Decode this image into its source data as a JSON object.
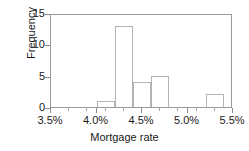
{
  "chart_data": {
    "type": "bar",
    "title": "",
    "subtitle": "",
    "xlabel": "Mortgage rate",
    "ylabel": "Frequency",
    "xlim": [
      3.5,
      5.5
    ],
    "ylim": [
      0,
      15
    ],
    "grid": false,
    "legend": null,
    "bin_width": 0.2,
    "x_tick_labels": [
      "3.5%",
      "4.0%",
      "4.5%",
      "5.0%",
      "5.5%"
    ],
    "x_tick_values": [
      3.5,
      4.0,
      4.5,
      5.0,
      5.5
    ],
    "x_minor_tick_values": [
      3.7,
      3.9,
      4.1,
      4.3,
      4.7,
      4.9,
      5.1,
      5.3
    ],
    "y_tick_labels": [
      "0",
      "5",
      "10",
      "15"
    ],
    "y_tick_values": [
      0,
      5,
      10,
      15
    ],
    "bins": [
      {
        "label": "4.0%-4.2%",
        "x0": 4.0,
        "x1": 4.2,
        "value": 1
      },
      {
        "label": "4.2%-4.4%",
        "x0": 4.2,
        "x1": 4.4,
        "value": 13
      },
      {
        "label": "4.4%-4.6%",
        "x0": 4.4,
        "x1": 4.6,
        "value": 4
      },
      {
        "label": "4.6%-4.8%",
        "x0": 4.6,
        "x1": 4.8,
        "value": 5
      },
      {
        "label": "5.2%-5.4%",
        "x0": 5.2,
        "x1": 5.4,
        "value": 2
      }
    ],
    "categories": [
      "4.0%-4.2%",
      "4.2%-4.4%",
      "4.4%-4.6%",
      "4.6%-4.8%",
      "5.2%-5.4%"
    ],
    "values": [
      1,
      13,
      4,
      5,
      2
    ],
    "colors": {
      "bar_edge": "#b3b3b3",
      "bar_fill": "#ffffff",
      "axis": "#9a9a9a",
      "text": "#1a1a1a",
      "background": "#ffffff"
    }
  }
}
